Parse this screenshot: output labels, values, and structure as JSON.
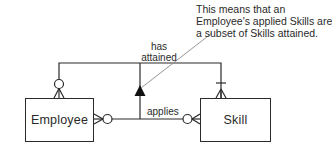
{
  "diagram": {
    "type": "entity-relationship",
    "entities": [
      {
        "id": "employee",
        "label": "Employee"
      },
      {
        "id": "skill",
        "label": "Skill"
      }
    ],
    "relationships": [
      {
        "id": "has-attained",
        "label_line1": "has",
        "label_line2": "attained",
        "from": "employee",
        "to": "skill",
        "employee_end": "zero-or-many",
        "skill_end": "one-or-many"
      },
      {
        "id": "applies",
        "label": "applies",
        "from": "employee",
        "to": "skill",
        "employee_end": "zero-or-many",
        "skill_end": "zero-or-many"
      }
    ],
    "constraint": {
      "type": "subset",
      "symbol": "triangle-arrow-up",
      "from": "applies",
      "to": "has-attained"
    },
    "annotation": {
      "lines": [
        "This means that an",
        "Employee's applied Skills are",
        "a subset of Skills attained."
      ]
    },
    "colors": {
      "line": "#2a2a2a",
      "annotation_leader": "#8a8a8a",
      "background": "#ffffff"
    }
  }
}
